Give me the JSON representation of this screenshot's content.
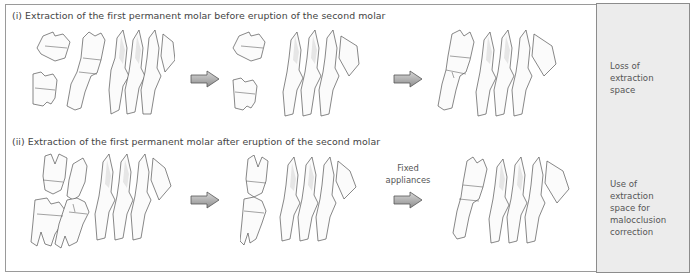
{
  "rows": [
    {
      "title": "(i) Extraction of the first permanent molar before eruption of the second molar",
      "stages": [
        "initial-dentition",
        "after-extraction",
        "result"
      ],
      "arrows": [
        {
          "label": ""
        },
        {
          "label": ""
        }
      ],
      "outcome": [
        "Loss of",
        "extraction",
        "space"
      ]
    },
    {
      "title": "(ii) Extraction of the first permanent molar after eruption of the second molar",
      "stages": [
        "initial-dentition",
        "after-extraction",
        "result"
      ],
      "arrows": [
        {
          "label": ""
        },
        {
          "label_lines": [
            "Fixed",
            "appliances"
          ]
        }
      ],
      "outcome": [
        "Use of",
        "extraction",
        "space for",
        "malocclusion",
        "correction"
      ]
    }
  ],
  "colors": {
    "frame_border": "#9a9a9a",
    "side_panel": "#ececec",
    "arrow_fill": "#a8a8a8"
  }
}
